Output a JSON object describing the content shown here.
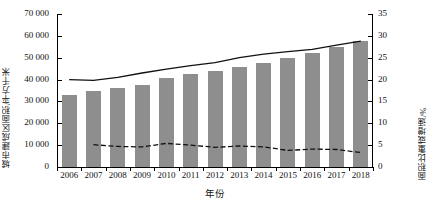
{
  "chart_data": {
    "type": "bar",
    "title": "",
    "xlabel": "年份",
    "ylabel": "城市建成区面积/平方千米",
    "ylabel_right": "面积比重或增速/%",
    "categories": [
      "2006",
      "2007",
      "2008",
      "2009",
      "2010",
      "2011",
      "2012",
      "2013",
      "2014",
      "2015",
      "2016",
      "2017",
      "2018"
    ],
    "ylim": [
      0,
      70000
    ],
    "ylim_right": [
      0,
      35
    ],
    "yticks": [
      "0",
      "10 000",
      "20 000",
      "30 000",
      "40 000",
      "50 000",
      "60 000",
      "70 000"
    ],
    "ytick_values": [
      0,
      10000,
      20000,
      30000,
      40000,
      50000,
      60000,
      70000
    ],
    "yticks_right": [
      "0",
      "5",
      "10",
      "15",
      "20",
      "25",
      "30",
      "35"
    ],
    "ytick_values_right": [
      0,
      5,
      10,
      15,
      20,
      25,
      30,
      35
    ],
    "grid": false,
    "legend_position": "none",
    "series": [
      {
        "name": "城市建成区面积",
        "type": "bar",
        "axis": "left",
        "color": "#8e8e8e",
        "values": [
          33000,
          34700,
          36300,
          37700,
          40500,
          42400,
          44000,
          45600,
          47800,
          49800,
          52100,
          55000,
          57600
        ]
      },
      {
        "name": "面积比重",
        "type": "line",
        "axis": "right",
        "style": "solid",
        "color": "#111111",
        "values": [
          20.0,
          19.8,
          20.5,
          21.5,
          22.4,
          23.2,
          23.9,
          25.0,
          25.8,
          26.4,
          26.9,
          27.9,
          28.8
        ]
      },
      {
        "name": "增速",
        "type": "line",
        "axis": "right",
        "style": "dashed",
        "color": "#111111",
        "values": [
          null,
          5.1,
          4.7,
          4.6,
          5.4,
          5.0,
          4.5,
          4.8,
          4.6,
          3.8,
          4.1,
          4.0,
          3.3
        ]
      }
    ]
  }
}
